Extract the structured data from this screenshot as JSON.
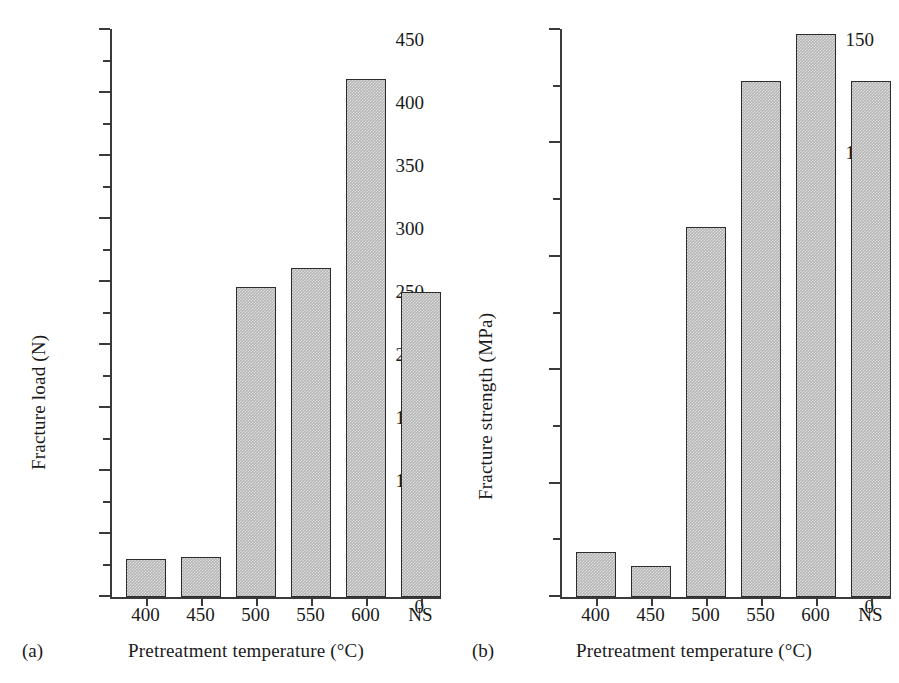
{
  "figure": {
    "background": "#ffffff",
    "bar_fill": "#b4b4b4",
    "bar_stroke": "#2c2c2c",
    "axis_color": "#3a3a3a"
  },
  "panels": [
    {
      "caption": "(a)",
      "chart_data": {
        "type": "bar",
        "title": "",
        "xlabel": "Pretreatment temperature (°C)",
        "ylabel": "Fracture load (N)",
        "categories": [
          "400",
          "450",
          "500",
          "550",
          "600",
          "NS"
        ],
        "values": [
          30,
          32,
          246,
          261,
          411,
          242
        ],
        "ylim": [
          0,
          450
        ],
        "yticks": [
          0,
          50,
          100,
          150,
          200,
          250,
          300,
          350,
          400,
          450
        ],
        "ytick_labels": [
          "0",
          "50",
          "100",
          "150",
          "200",
          "250",
          "300",
          "350",
          "400",
          "450"
        ],
        "yminor_step": 25,
        "grid": false,
        "legend": "none"
      }
    },
    {
      "caption": "(b)",
      "chart_data": {
        "type": "bar",
        "title": "",
        "xlabel": "Pretreatment temperature (°C)",
        "ylabel": "Fracture strength (MPa)",
        "categories": [
          "400",
          "450",
          "500",
          "550",
          "600",
          "NS"
        ],
        "values": [
          11.8,
          8.1,
          98,
          136.5,
          149,
          136.5
        ],
        "ylim": [
          0,
          150
        ],
        "yticks": [
          0,
          30,
          60,
          90,
          120,
          150
        ],
        "ytick_labels": [
          "0",
          "30",
          "60",
          "90",
          "120",
          "150"
        ],
        "yminor_step": 15,
        "grid": false,
        "legend": "none"
      }
    }
  ]
}
